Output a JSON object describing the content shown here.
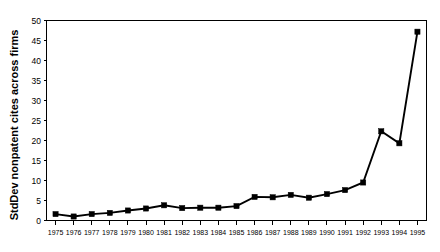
{
  "chart_data": {
    "type": "line",
    "title": "",
    "subtitle": "",
    "xlabel": "",
    "ylabel": "StdDev nonpatent cites across firms",
    "xlim": [
      1974.5,
      1995.5
    ],
    "ylim": [
      0,
      50
    ],
    "y_ticks": [
      0,
      5,
      10,
      15,
      20,
      25,
      30,
      35,
      40,
      45,
      50
    ],
    "y_tick_labels": [
      "0",
      "5",
      "10",
      "15",
      "20",
      "25",
      "30",
      "35",
      "40",
      "45",
      "50"
    ],
    "grid": false,
    "legend": null,
    "legend_position": "none",
    "marker": "square",
    "line_color": "#000000",
    "marker_color": "#000000",
    "categories": [
      "1975",
      "1976",
      "1977",
      "1978",
      "1979",
      "1980",
      "1981",
      "1982",
      "1983",
      "1984",
      "1985",
      "1986",
      "1987",
      "1988",
      "1989",
      "1990",
      "1991",
      "1992",
      "1993",
      "1994",
      "1995"
    ],
    "x": [
      1975,
      1976,
      1977,
      1978,
      1979,
      1980,
      1981,
      1982,
      1983,
      1984,
      1985,
      1986,
      1987,
      1988,
      1989,
      1990,
      1991,
      1992,
      1993,
      1994,
      1995
    ],
    "values": [
      1.6,
      1.0,
      1.6,
      1.9,
      2.5,
      3.0,
      3.8,
      3.1,
      3.2,
      3.2,
      3.6,
      5.9,
      5.8,
      6.4,
      5.7,
      6.6,
      7.6,
      9.5,
      22.3,
      19.3,
      47.2
    ],
    "series": [
      {
        "name": "StdDev nonpatent cites across firms",
        "values": [
          1.6,
          1.0,
          1.6,
          1.9,
          2.5,
          3.0,
          3.8,
          3.1,
          3.2,
          3.2,
          3.6,
          5.9,
          5.8,
          6.4,
          5.7,
          6.6,
          7.6,
          9.5,
          22.3,
          19.3,
          47.2
        ]
      }
    ]
  },
  "figure": {
    "background_color": "#ffffff",
    "frame_color": "#000000"
  }
}
